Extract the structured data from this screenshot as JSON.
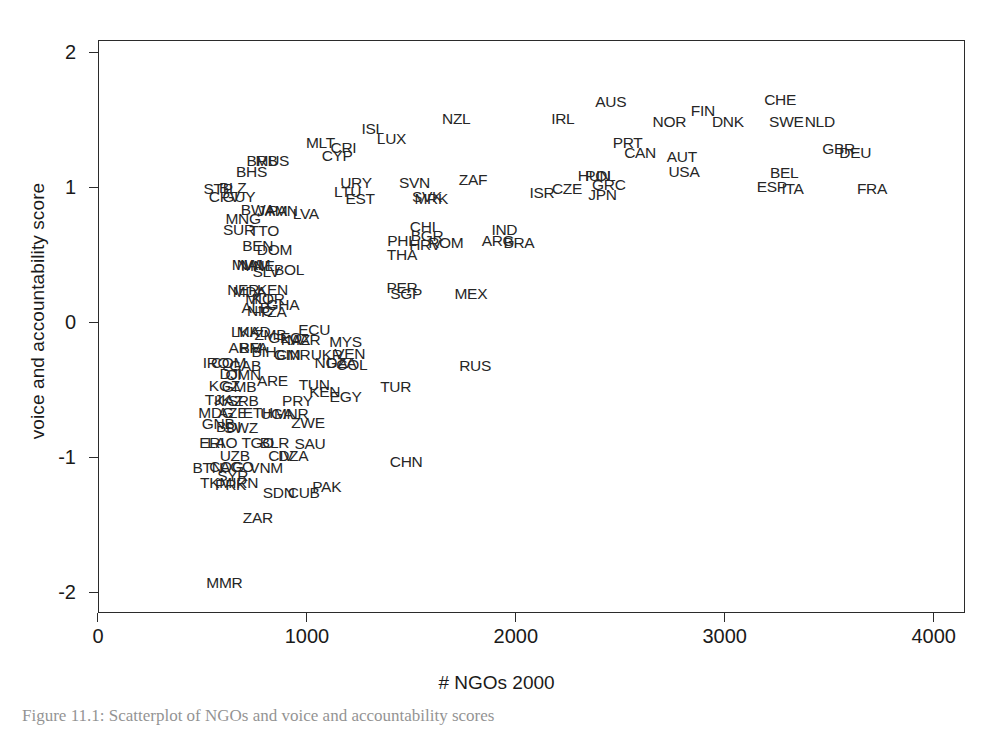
{
  "figure": {
    "caption": "Figure 11.1: Scatterplot of NGOs and voice and accountability scores"
  },
  "chart_data": {
    "type": "scatter",
    "title": "",
    "xlabel": "# NGOs 2000",
    "ylabel": "voice and accountability score",
    "xlim": [
      0,
      4150
    ],
    "ylim": [
      -2.15,
      2.1
    ],
    "xticks": [
      0,
      1000,
      2000,
      3000,
      4000
    ],
    "xticklabels": [
      "0",
      "1000",
      "2000",
      "3000",
      "4000"
    ],
    "yticks": [
      2,
      1,
      0,
      -1,
      -2
    ],
    "yticklabels": [
      "2",
      "1",
      "0",
      "-1",
      "-2"
    ],
    "grid": false,
    "legend": null,
    "marker_style": "text-label (ISO3 country code)",
    "points": [
      {
        "label": "AUS",
        "x": 2450,
        "y": 1.65
      },
      {
        "label": "CHE",
        "x": 3260,
        "y": 1.66
      },
      {
        "label": "FIN",
        "x": 2890,
        "y": 1.58
      },
      {
        "label": "NOR",
        "x": 2730,
        "y": 1.5
      },
      {
        "label": "DNK",
        "x": 3010,
        "y": 1.5
      },
      {
        "label": "SWE",
        "x": 3290,
        "y": 1.5
      },
      {
        "label": "NLD",
        "x": 3450,
        "y": 1.5
      },
      {
        "label": "IRL",
        "x": 2220,
        "y": 1.52
      },
      {
        "label": "NZL",
        "x": 1710,
        "y": 1.52
      },
      {
        "label": "ISL",
        "x": 1310,
        "y": 1.45
      },
      {
        "label": "LUX",
        "x": 1400,
        "y": 1.37
      },
      {
        "label": "MLT",
        "x": 1060,
        "y": 1.34
      },
      {
        "label": "CRI",
        "x": 1170,
        "y": 1.31
      },
      {
        "label": "CYP",
        "x": 1140,
        "y": 1.25
      },
      {
        "label": "PRT",
        "x": 2530,
        "y": 1.34
      },
      {
        "label": "CAN",
        "x": 2590,
        "y": 1.27
      },
      {
        "label": "AUT",
        "x": 2790,
        "y": 1.24
      },
      {
        "label": "USA",
        "x": 2800,
        "y": 1.13
      },
      {
        "label": "GBR",
        "x": 3540,
        "y": 1.3
      },
      {
        "label": "DEU",
        "x": 3620,
        "y": 1.27
      },
      {
        "label": "BEL",
        "x": 3280,
        "y": 1.12
      },
      {
        "label": "ESP",
        "x": 3220,
        "y": 1.02
      },
      {
        "label": "ITA",
        "x": 3320,
        "y": 1.0
      },
      {
        "label": "FRA",
        "x": 3700,
        "y": 1.0
      },
      {
        "label": "BRB",
        "x": 780,
        "y": 1.21
      },
      {
        "label": "MUS",
        "x": 830,
        "y": 1.21
      },
      {
        "label": "BHS",
        "x": 730,
        "y": 1.13
      },
      {
        "label": "STP",
        "x": 570,
        "y": 1.0
      },
      {
        "label": "BLZ",
        "x": 640,
        "y": 1.01
      },
      {
        "label": "CPV",
        "x": 600,
        "y": 0.94
      },
      {
        "label": "GUY",
        "x": 670,
        "y": 0.94
      },
      {
        "label": "URY",
        "x": 1230,
        "y": 1.05
      },
      {
        "label": "LTU",
        "x": 1190,
        "y": 0.98
      },
      {
        "label": "EST",
        "x": 1250,
        "y": 0.93
      },
      {
        "label": "SVN",
        "x": 1510,
        "y": 1.05
      },
      {
        "label": "SVK",
        "x": 1570,
        "y": 0.94
      },
      {
        "label": "MRK",
        "x": 1590,
        "y": 0.93
      },
      {
        "label": "ZAF",
        "x": 1790,
        "y": 1.07
      },
      {
        "label": "HUN",
        "x": 2370,
        "y": 1.1
      },
      {
        "label": "POL",
        "x": 2400,
        "y": 1.1
      },
      {
        "label": "GRC",
        "x": 2440,
        "y": 1.03
      },
      {
        "label": "CZE",
        "x": 2240,
        "y": 1.0
      },
      {
        "label": "JPN",
        "x": 2410,
        "y": 0.96
      },
      {
        "label": "ISR",
        "x": 2120,
        "y": 0.97
      },
      {
        "label": "BWA",
        "x": 760,
        "y": 0.85
      },
      {
        "label": "JAM",
        "x": 830,
        "y": 0.84
      },
      {
        "label": "PAN",
        "x": 880,
        "y": 0.84
      },
      {
        "label": "LVA",
        "x": 990,
        "y": 0.82
      },
      {
        "label": "MNG",
        "x": 690,
        "y": 0.78
      },
      {
        "label": "SUR",
        "x": 670,
        "y": 0.7
      },
      {
        "label": "TTO",
        "x": 790,
        "y": 0.69
      },
      {
        "label": "CHL",
        "x": 1560,
        "y": 0.72
      },
      {
        "label": "BGR",
        "x": 1570,
        "y": 0.65
      },
      {
        "label": "HRV",
        "x": 1560,
        "y": 0.59
      },
      {
        "label": "ROM",
        "x": 1660,
        "y": 0.6
      },
      {
        "label": "PHL",
        "x": 1450,
        "y": 0.62
      },
      {
        "label": "THA",
        "x": 1450,
        "y": 0.51
      },
      {
        "label": "IND",
        "x": 1940,
        "y": 0.7
      },
      {
        "label": "ARG",
        "x": 1910,
        "y": 0.62
      },
      {
        "label": "BRA",
        "x": 2010,
        "y": 0.6
      },
      {
        "label": "BEN",
        "x": 760,
        "y": 0.58
      },
      {
        "label": "DOM",
        "x": 840,
        "y": 0.55
      },
      {
        "label": "MWI",
        "x": 710,
        "y": 0.44
      },
      {
        "label": "NAM",
        "x": 740,
        "y": 0.44
      },
      {
        "label": "MNE",
        "x": 760,
        "y": 0.43
      },
      {
        "label": "SLV",
        "x": 800,
        "y": 0.39
      },
      {
        "label": "BOL",
        "x": 910,
        "y": 0.4
      },
      {
        "label": "PER",
        "x": 1450,
        "y": 0.27
      },
      {
        "label": "SGP",
        "x": 1470,
        "y": 0.22
      },
      {
        "label": "MEX",
        "x": 1780,
        "y": 0.22
      },
      {
        "label": "NER",
        "x": 690,
        "y": 0.25
      },
      {
        "label": "MDA",
        "x": 720,
        "y": 0.24
      },
      {
        "label": "KEN",
        "x": 830,
        "y": 0.25
      },
      {
        "label": "MLI",
        "x": 760,
        "y": 0.19
      },
      {
        "label": "KOR",
        "x": 810,
        "y": 0.19
      },
      {
        "label": "GHA",
        "x": 880,
        "y": 0.14
      },
      {
        "label": "ALB",
        "x": 750,
        "y": 0.12
      },
      {
        "label": "NIC",
        "x": 770,
        "y": 0.1
      },
      {
        "label": "TZA",
        "x": 830,
        "y": 0.09
      },
      {
        "label": "LKA",
        "x": 700,
        "y": -0.06
      },
      {
        "label": "MKD",
        "x": 740,
        "y": -0.06
      },
      {
        "label": "ZMB",
        "x": 820,
        "y": -0.08
      },
      {
        "label": "GEO",
        "x": 890,
        "y": -0.1
      },
      {
        "label": "KAZ",
        "x": 940,
        "y": -0.12
      },
      {
        "label": "MAR",
        "x": 980,
        "y": -0.12
      },
      {
        "label": "ECU",
        "x": 1030,
        "y": -0.04
      },
      {
        "label": "MYS",
        "x": 1180,
        "y": -0.13
      },
      {
        "label": "ARM",
        "x": 700,
        "y": -0.18
      },
      {
        "label": "BFA",
        "x": 740,
        "y": -0.18
      },
      {
        "label": "BIH",
        "x": 790,
        "y": -0.21
      },
      {
        "label": "GIN",
        "x": 900,
        "y": -0.23
      },
      {
        "label": "CMR",
        "x": 930,
        "y": -0.23
      },
      {
        "label": "UKR",
        "x": 1090,
        "y": -0.23
      },
      {
        "label": "VEN",
        "x": 1200,
        "y": -0.22
      },
      {
        "label": "NGA",
        "x": 1110,
        "y": -0.29
      },
      {
        "label": "DZA",
        "x": 1160,
        "y": -0.29
      },
      {
        "label": "COL",
        "x": 1210,
        "y": -0.3
      },
      {
        "label": "RUS",
        "x": 1800,
        "y": -0.31
      },
      {
        "label": "IRQ",
        "x": 560,
        "y": -0.29
      },
      {
        "label": "COM",
        "x": 620,
        "y": -0.29
      },
      {
        "label": "GAB",
        "x": 700,
        "y": -0.31
      },
      {
        "label": "DJI",
        "x": 630,
        "y": -0.37
      },
      {
        "label": "OMN",
        "x": 690,
        "y": -0.38
      },
      {
        "label": "ARE",
        "x": 830,
        "y": -0.42
      },
      {
        "label": "KGZ",
        "x": 600,
        "y": -0.46
      },
      {
        "label": "GMB",
        "x": 670,
        "y": -0.47
      },
      {
        "label": "TUN",
        "x": 1030,
        "y": -0.45
      },
      {
        "label": "KEN2",
        "x": 1080,
        "y": -0.5
      },
      {
        "label": "EGY",
        "x": 1180,
        "y": -0.54
      },
      {
        "label": "TUR",
        "x": 1420,
        "y": -0.47
      },
      {
        "label": "TJK",
        "x": 570,
        "y": -0.56
      },
      {
        "label": "KAZ2",
        "x": 620,
        "y": -0.57
      },
      {
        "label": "SRB",
        "x": 690,
        "y": -0.57
      },
      {
        "label": "PRY",
        "x": 950,
        "y": -0.57
      },
      {
        "label": "MDG",
        "x": 560,
        "y": -0.66
      },
      {
        "label": "AZE",
        "x": 640,
        "y": -0.66
      },
      {
        "label": "ETH",
        "x": 760,
        "y": -0.66
      },
      {
        "label": "UGA",
        "x": 850,
        "y": -0.67
      },
      {
        "label": "MNR",
        "x": 920,
        "y": -0.67
      },
      {
        "label": "GNB",
        "x": 570,
        "y": -0.74
      },
      {
        "label": "BDI",
        "x": 620,
        "y": -0.76
      },
      {
        "label": "SWZ",
        "x": 680,
        "y": -0.77
      },
      {
        "label": "ZWE",
        "x": 1000,
        "y": -0.73
      },
      {
        "label": "ERI",
        "x": 540,
        "y": -0.88
      },
      {
        "label": "LAO",
        "x": 590,
        "y": -0.88
      },
      {
        "label": "TGO",
        "x": 760,
        "y": -0.88
      },
      {
        "label": "BLR",
        "x": 840,
        "y": -0.88
      },
      {
        "label": "SAU",
        "x": 1010,
        "y": -0.89
      },
      {
        "label": "UZB",
        "x": 650,
        "y": -0.98
      },
      {
        "label": "CIV",
        "x": 870,
        "y": -0.98
      },
      {
        "label": "DZA2",
        "x": 930,
        "y": -0.98
      },
      {
        "label": "CHN",
        "x": 1470,
        "y": -1.02
      },
      {
        "label": "BTN",
        "x": 520,
        "y": -1.07
      },
      {
        "label": "COG",
        "x": 610,
        "y": -1.06
      },
      {
        "label": "AGO",
        "x": 660,
        "y": -1.06
      },
      {
        "label": "VNM",
        "x": 800,
        "y": -1.07
      },
      {
        "label": "SYR",
        "x": 640,
        "y": -1.13
      },
      {
        "label": "TKM",
        "x": 560,
        "y": -1.18
      },
      {
        "label": "PRK",
        "x": 630,
        "y": -1.19
      },
      {
        "label": "IRN",
        "x": 700,
        "y": -1.18
      },
      {
        "label": "SDN",
        "x": 860,
        "y": -1.25
      },
      {
        "label": "CUB",
        "x": 980,
        "y": -1.25
      },
      {
        "label": "PAK",
        "x": 1090,
        "y": -1.21
      },
      {
        "label": "ZAR",
        "x": 760,
        "y": -1.44
      },
      {
        "label": "MMR",
        "x": 600,
        "y": -1.92
      }
    ]
  }
}
